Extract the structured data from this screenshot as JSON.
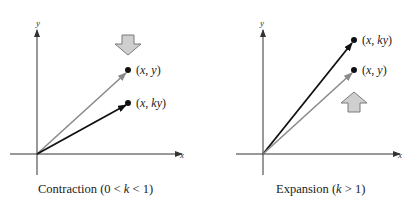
{
  "panels": [
    {
      "name": "contraction",
      "caption_pre": "Contraction (0 < ",
      "caption_k": "k",
      "caption_post": " < 1)",
      "x_axis_label": "x",
      "y_axis_label": "y",
      "points": [
        {
          "label_pre": "(",
          "label_x": "x",
          "label_mid": ", ",
          "label_y": "y",
          "label_post": ")",
          "role": "original",
          "color": "#8a8a8a"
        },
        {
          "label_pre": "(",
          "label_x": "x",
          "label_mid": ", ",
          "label_y": "ky",
          "label_post": ")",
          "role": "transformed",
          "color": "#111111"
        }
      ],
      "arrow_direction": "down"
    },
    {
      "name": "expansion",
      "caption_pre": "Expansion (",
      "caption_k": "k",
      "caption_post": " > 1)",
      "x_axis_label": "x",
      "y_axis_label": "y",
      "points": [
        {
          "label_pre": "(",
          "label_x": "x",
          "label_mid": ", ",
          "label_y": "ky",
          "label_post": ")",
          "role": "transformed",
          "color": "#111111"
        },
        {
          "label_pre": "(",
          "label_x": "x",
          "label_mid": ", ",
          "label_y": "y",
          "label_post": ")",
          "role": "original",
          "color": "#8a8a8a"
        }
      ],
      "arrow_direction": "up"
    }
  ],
  "colors": {
    "arrow_fill": "#cfcfcf",
    "arrow_stroke": "#7a7a7a",
    "axis": "#333333"
  }
}
